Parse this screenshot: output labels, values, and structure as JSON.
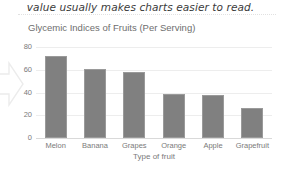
{
  "prose": {
    "line": "value usually makes charts easier to read."
  },
  "chart_data": {
    "type": "bar",
    "title": "Glycemic Indices of Fruits (Per Serving)",
    "xlabel": "Type of fruit",
    "ylabel": "",
    "categories": [
      "Melon",
      "Banana",
      "Grapes",
      "Orange",
      "Apple",
      "Grapefruit"
    ],
    "values": [
      72,
      61,
      58,
      39,
      38,
      26
    ],
    "ylim": [
      0,
      80
    ],
    "yticks": [
      0,
      20,
      40,
      60,
      80
    ],
    "ytick_labels": [
      "0",
      "20",
      "40",
      "60",
      "80"
    ],
    "grid": true,
    "legend": "none",
    "bar_color": "#808080",
    "bar_border_color": "#9a9a9a",
    "gridline_color": "#ededed",
    "axis_color": "#d9d9d9",
    "title_color": "#6e6e6e",
    "tick_label_color": "#7a7a7a"
  },
  "annotations": {
    "arrow": {
      "name": "right-pointing callout arrow",
      "color": "#ececec"
    }
  }
}
